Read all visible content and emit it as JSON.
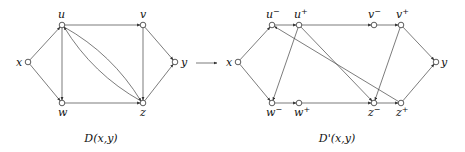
{
  "left_graph": {
    "caption": "D(x,y)",
    "nodes": [
      {
        "id": "x",
        "label": "x",
        "cx": 28,
        "cy": 62,
        "lx": 16,
        "ly": 66
      },
      {
        "id": "u",
        "label": "u",
        "cx": 62,
        "cy": 25,
        "lx": 58,
        "ly": 18
      },
      {
        "id": "v",
        "label": "v",
        "cx": 143,
        "cy": 25,
        "lx": 140,
        "ly": 18
      },
      {
        "id": "y",
        "label": "y",
        "cx": 175,
        "cy": 62,
        "lx": 181,
        "ly": 66
      },
      {
        "id": "w",
        "label": "w",
        "cx": 62,
        "cy": 103,
        "lx": 58,
        "ly": 116
      },
      {
        "id": "z",
        "label": "z",
        "cx": 143,
        "cy": 103,
        "lx": 140,
        "ly": 116
      }
    ],
    "edges": [
      {
        "from": "x",
        "to": "u"
      },
      {
        "from": "x",
        "to": "w"
      },
      {
        "from": "u",
        "to": "v"
      },
      {
        "from": "u",
        "to": "w"
      },
      {
        "from": "w",
        "to": "z"
      },
      {
        "from": "v",
        "to": "z"
      },
      {
        "from": "v",
        "to": "y"
      },
      {
        "from": "z",
        "to": "y"
      },
      {
        "from": "u",
        "to": "z",
        "curve": "upper"
      },
      {
        "from": "z",
        "to": "u",
        "curve": "lower"
      }
    ]
  },
  "arrow_between": {
    "from": "D(x,y)",
    "to": "D'(x,y)"
  },
  "right_graph": {
    "caption": "D'(x,y)",
    "nodes": [
      {
        "id": "x",
        "label": "x",
        "sup": "",
        "cx": 238,
        "cy": 62,
        "lx": 226,
        "ly": 66
      },
      {
        "id": "u-",
        "label": "u",
        "sup": "−",
        "cx": 272,
        "cy": 25,
        "lx": 266,
        "ly": 18
      },
      {
        "id": "u+",
        "label": "u",
        "sup": "+",
        "cx": 299,
        "cy": 25,
        "lx": 294,
        "ly": 18
      },
      {
        "id": "v-",
        "label": "v",
        "sup": "−",
        "cx": 374,
        "cy": 25,
        "lx": 368,
        "ly": 18
      },
      {
        "id": "v+",
        "label": "v",
        "sup": "+",
        "cx": 401,
        "cy": 25,
        "lx": 396,
        "ly": 18
      },
      {
        "id": "y",
        "label": "y",
        "sup": "",
        "cx": 436,
        "cy": 62,
        "lx": 441,
        "ly": 66
      },
      {
        "id": "w-",
        "label": "w",
        "sup": "−",
        "cx": 272,
        "cy": 103,
        "lx": 266,
        "ly": 116
      },
      {
        "id": "w+",
        "label": "w",
        "sup": "+",
        "cx": 299,
        "cy": 103,
        "lx": 294,
        "ly": 116
      },
      {
        "id": "z-",
        "label": "z",
        "sup": "−",
        "cx": 374,
        "cy": 103,
        "lx": 368,
        "ly": 116
      },
      {
        "id": "z+",
        "label": "z",
        "sup": "+",
        "cx": 401,
        "cy": 103,
        "lx": 396,
        "ly": 116
      }
    ],
    "edges": [
      {
        "from": "x",
        "to": "u-"
      },
      {
        "from": "x",
        "to": "w-"
      },
      {
        "from": "u-",
        "to": "u+"
      },
      {
        "from": "u+",
        "to": "v-"
      },
      {
        "from": "v-",
        "to": "v+"
      },
      {
        "from": "v+",
        "to": "y"
      },
      {
        "from": "w-",
        "to": "w+"
      },
      {
        "from": "w+",
        "to": "z-"
      },
      {
        "from": "z-",
        "to": "z+"
      },
      {
        "from": "z+",
        "to": "y"
      },
      {
        "from": "u+",
        "to": "z-"
      },
      {
        "from": "z+",
        "to": "u-"
      },
      {
        "from": "u+",
        "to": "w-"
      },
      {
        "from": "v+",
        "to": "z-"
      }
    ]
  }
}
